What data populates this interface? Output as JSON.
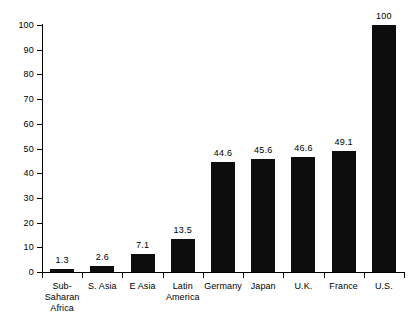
{
  "chart_data": {
    "type": "bar",
    "title": "",
    "subtitle": "",
    "xlabel": "",
    "ylabel": "",
    "ylim": [
      0,
      100
    ],
    "yticks": [
      0,
      10,
      20,
      30,
      40,
      50,
      60,
      70,
      80,
      90,
      100
    ],
    "grid": false,
    "legend": null,
    "orientation": "vertical",
    "bar_color": "#0d0d0d",
    "axis_color": "#000000",
    "background": "#ffffff",
    "categories": [
      "Sub-\nSaharan\nAfrica",
      "S. Asia",
      "E Asia",
      "Latin\nAmerica",
      "Germany",
      "Japan",
      "U.K.",
      "France",
      "U.S."
    ],
    "values": [
      1.3,
      2.6,
      7.1,
      13.5,
      44.6,
      45.6,
      46.6,
      49.1,
      100
    ],
    "value_labels": [
      "1.3",
      "2.6",
      "7.1",
      "13.5",
      "44.6",
      "45.6",
      "46.6",
      "49.1",
      "100"
    ],
    "ytick_labels": [
      "0",
      "10",
      "20",
      "30",
      "40",
      "50",
      "60",
      "70",
      "80",
      "90",
      "100"
    ]
  }
}
